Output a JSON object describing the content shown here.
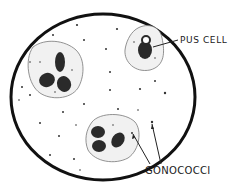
{
  "diagram": {
    "type": "microscope-field",
    "colors": {
      "background": "#ffffff",
      "outline": "#111111",
      "cell_fill": "#f2f2f2",
      "nucleus": "#2a2a2a"
    },
    "labels": {
      "pus_cell": "PUS CELL",
      "gonococci": "GONOCOCCI"
    },
    "elements": {
      "field_circle": "microscope-field",
      "cells": [
        {
          "name": "pus-cell-left",
          "nucleus_lobes": 3
        },
        {
          "name": "pus-cell-top-right",
          "nucleus_lobes": 1
        },
        {
          "name": "pus-cell-bottom",
          "nucleus_lobes": 3
        }
      ]
    }
  }
}
